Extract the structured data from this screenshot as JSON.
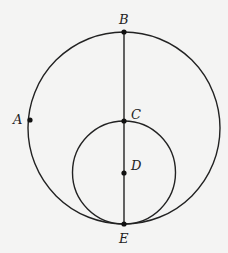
{
  "figure": {
    "type": "geometry-diagram",
    "background_color": "#f4f4f3",
    "stroke_color": "#222222",
    "circles": [
      {
        "name": "large-circle",
        "cx": 124,
        "cy": 128,
        "r": 96
      },
      {
        "name": "small-circle",
        "cx": 124,
        "cy": 172.5,
        "r": 51.5
      }
    ],
    "segment": {
      "name": "diameter-BE",
      "from": "B",
      "to": "E"
    },
    "points": [
      {
        "label": "A",
        "x": 30,
        "y": 120
      },
      {
        "label": "B",
        "x": 124,
        "y": 32
      },
      {
        "label": "C",
        "x": 124,
        "y": 121
      },
      {
        "label": "D",
        "x": 124,
        "y": 173
      },
      {
        "label": "E",
        "x": 124,
        "y": 224
      }
    ],
    "labels": {
      "A": "A",
      "B": "B",
      "C": "C",
      "D": "D",
      "E": "E"
    }
  }
}
